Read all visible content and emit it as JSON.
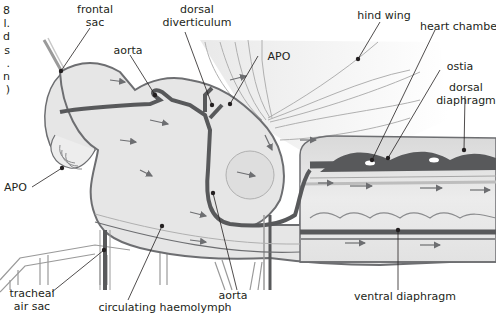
{
  "figure": {
    "truncated_caption_chars": [
      "8",
      "l.",
      "d",
      "s",
      ".",
      "n",
      ")"
    ]
  },
  "labels": {
    "frontal_sac": [
      "frontal",
      "sac"
    ],
    "dorsal_diverticulum": [
      "dorsal",
      "diverticulum"
    ],
    "aorta_top": "aorta",
    "apo_top": "APO",
    "hind_wing": "hind wing",
    "heart_chamber": "heart chamber",
    "ostia": "ostia",
    "dorsal_diaphragm": [
      "dorsal",
      "diaphragm"
    ],
    "apo_left": "APO",
    "tracheal_air_sac": [
      "tracheal",
      "air sac"
    ],
    "circulating_haemolymph": "circulating haemolymph",
    "aorta_bottom": "aorta",
    "ventral_diaphragm": "ventral diaphragm"
  },
  "colors": {
    "body_fill": "#e6e6e6",
    "outline": "#6d6e71",
    "vessel": "#58595b",
    "vessel_light": "#8a8b8d",
    "wing_fill": "#f0f0f0",
    "leader": "#231f20",
    "text": "#231f20"
  }
}
